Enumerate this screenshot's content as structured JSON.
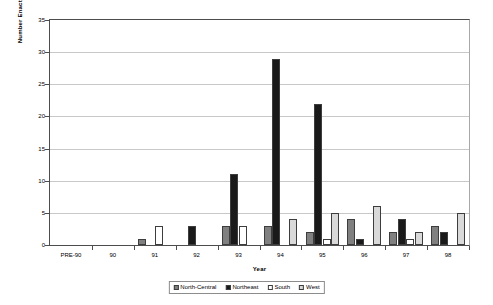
{
  "chart_data": {
    "type": "bar",
    "title": "",
    "xlabel": "Year",
    "ylabel": "Number Enacted",
    "ylim": [
      0,
      35
    ],
    "ytick_step": 5,
    "yticks": [
      0,
      5,
      10,
      15,
      20,
      25,
      30,
      35
    ],
    "grid": true,
    "legend_position": "bottom",
    "categories": [
      "PRE-90",
      "90",
      "91",
      "92",
      "93",
      "94",
      "95",
      "96",
      "97",
      "98"
    ],
    "series": [
      {
        "name": "North-Central",
        "color": "#808080",
        "values": [
          0,
          0,
          1,
          0,
          3,
          3,
          2,
          4,
          2,
          3
        ]
      },
      {
        "name": "Northeast",
        "color": "#1a1a1a",
        "values": [
          0,
          0,
          0,
          3,
          11,
          29,
          22,
          1,
          4,
          2
        ]
      },
      {
        "name": "South",
        "color": "#ffffff",
        "values": [
          0,
          0,
          3,
          0,
          3,
          0,
          1,
          0,
          1,
          0
        ]
      },
      {
        "name": "West",
        "color": "#d9d9d9",
        "values": [
          0,
          0,
          0,
          0,
          0,
          4,
          5,
          6,
          2,
          5
        ]
      }
    ]
  },
  "legend": {
    "items": [
      {
        "label": "North-Central"
      },
      {
        "label": "Northeast"
      },
      {
        "label": "South"
      },
      {
        "label": "West"
      }
    ]
  }
}
